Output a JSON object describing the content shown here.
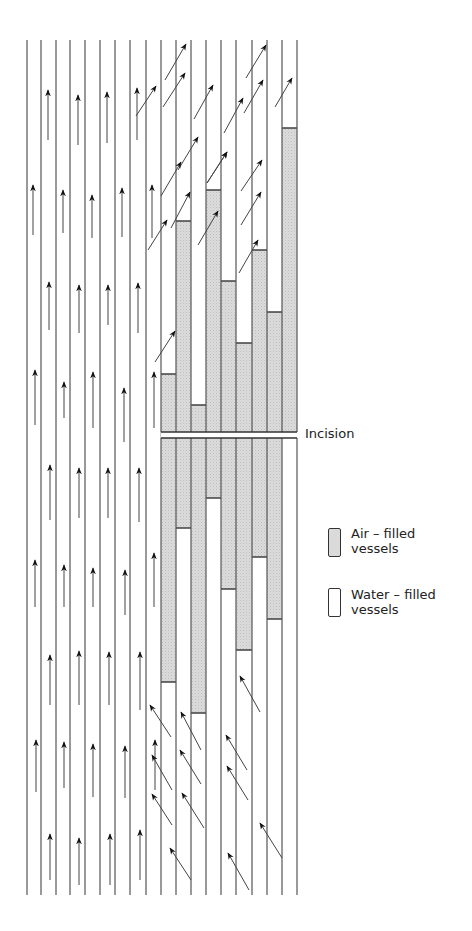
{
  "diagram": {
    "labels": {
      "incision": "Incision"
    },
    "legend": [
      {
        "label_line1": "Air – filled",
        "label_line2": "vessels",
        "fill": "#d9d9d9"
      },
      {
        "label_line1": "Water – filled",
        "label_line2": "vessels",
        "fill": "#ffffff"
      }
    ],
    "colors": {
      "line": "#555555",
      "arrow": "#111111",
      "air_fill": "#d6d6d6",
      "background": "#ffffff"
    },
    "vessel_lines_x": [
      27,
      41,
      56,
      70,
      85,
      100,
      115,
      130,
      146,
      161,
      176,
      191,
      206,
      221,
      236,
      252,
      267,
      282,
      297
    ],
    "vessel_top_y": 40,
    "vessel_bottom_y": 895,
    "incision": {
      "x1": 161,
      "x2": 297,
      "y_top": 432,
      "y_bottom": 438
    },
    "cut_vessels": [
      {
        "x1": 161,
        "x2": 176,
        "air_top": 374,
        "air_bottom": 682
      },
      {
        "x1": 176,
        "x2": 191,
        "air_top": 221,
        "air_bottom": 528
      },
      {
        "x1": 191,
        "x2": 206,
        "air_top": 405,
        "air_bottom": 713
      },
      {
        "x1": 206,
        "x2": 221,
        "air_top": 190,
        "air_bottom": 498
      },
      {
        "x1": 221,
        "x2": 236,
        "air_top": 281,
        "air_bottom": 589
      },
      {
        "x1": 236,
        "x2": 252,
        "air_top": 343,
        "air_bottom": 650
      },
      {
        "x1": 252,
        "x2": 267,
        "air_top": 250,
        "air_bottom": 557
      },
      {
        "x1": 267,
        "x2": 282,
        "air_top": 312,
        "air_bottom": 619
      },
      {
        "x1": 282,
        "x2": 297,
        "air_top": 128,
        "air_bottom": 438
      }
    ],
    "up_arrows": [
      [
        48,
        90,
        140
      ],
      [
        78,
        95,
        145
      ],
      [
        107,
        92,
        143
      ],
      [
        137,
        88,
        140
      ],
      [
        33,
        185,
        235
      ],
      [
        63,
        190,
        233
      ],
      [
        92,
        195,
        238
      ],
      [
        122,
        188,
        237
      ],
      [
        152,
        185,
        238
      ],
      [
        49,
        282,
        330
      ],
      [
        79,
        285,
        333
      ],
      [
        108,
        285,
        325
      ],
      [
        138,
        283,
        333
      ],
      [
        35,
        370,
        425
      ],
      [
        64,
        382,
        418
      ],
      [
        93,
        372,
        428
      ],
      [
        124,
        388,
        442
      ],
      [
        154,
        372,
        428
      ],
      [
        50,
        465,
        520
      ],
      [
        79,
        468,
        518
      ],
      [
        108,
        468,
        518
      ],
      [
        139,
        468,
        522
      ],
      [
        35,
        560,
        607
      ],
      [
        64,
        565,
        607
      ],
      [
        93,
        568,
        607
      ],
      [
        125,
        570,
        615
      ],
      [
        154,
        553,
        607
      ],
      [
        50,
        655,
        705
      ],
      [
        79,
        651,
        705
      ],
      [
        109,
        652,
        705
      ],
      [
        140,
        652,
        710
      ],
      [
        36,
        740,
        792
      ],
      [
        64,
        742,
        788
      ],
      [
        93,
        744,
        797
      ],
      [
        125,
        746,
        798
      ],
      [
        155,
        740,
        790
      ],
      [
        50,
        834,
        880
      ],
      [
        79,
        838,
        885
      ],
      [
        110,
        834,
        885
      ],
      [
        140,
        830,
        880
      ]
    ],
    "diag_up_arrows": [
      [
        186,
        44,
        165,
        80
      ],
      [
        266,
        45,
        246,
        78
      ],
      [
        185,
        73,
        163,
        107
      ],
      [
        263,
        80,
        244,
        113
      ],
      [
        292,
        78,
        275,
        107
      ],
      [
        156,
        86,
        136,
        116
      ],
      [
        213,
        85,
        194,
        119
      ],
      [
        243,
        98,
        224,
        133
      ],
      [
        198,
        137,
        178,
        170
      ],
      [
        227,
        152,
        207,
        183
      ],
      [
        262,
        160,
        241,
        191
      ],
      [
        181,
        162,
        161,
        196
      ],
      [
        227,
        152,
        207,
        183
      ],
      [
        190,
        192,
        171,
        228
      ],
      [
        261,
        192,
        241,
        225
      ],
      [
        218,
        211,
        198,
        245
      ],
      [
        167,
        220,
        148,
        250
      ],
      [
        258,
        240,
        239,
        273
      ],
      [
        175,
        331,
        155,
        362
      ]
    ],
    "diag_down_arrows": [
      [
        150,
        705,
        171,
        737
      ],
      [
        181,
        712,
        201,
        750
      ],
      [
        240,
        676,
        260,
        712
      ],
      [
        180,
        750,
        201,
        784
      ],
      [
        152,
        794,
        172,
        825
      ],
      [
        226,
        735,
        247,
        770
      ],
      [
        227,
        766,
        248,
        800
      ],
      [
        182,
        793,
        204,
        828
      ],
      [
        260,
        823,
        282,
        858
      ],
      [
        170,
        848,
        191,
        880
      ],
      [
        228,
        853,
        249,
        890
      ],
      [
        152,
        755,
        172,
        790
      ]
    ]
  }
}
